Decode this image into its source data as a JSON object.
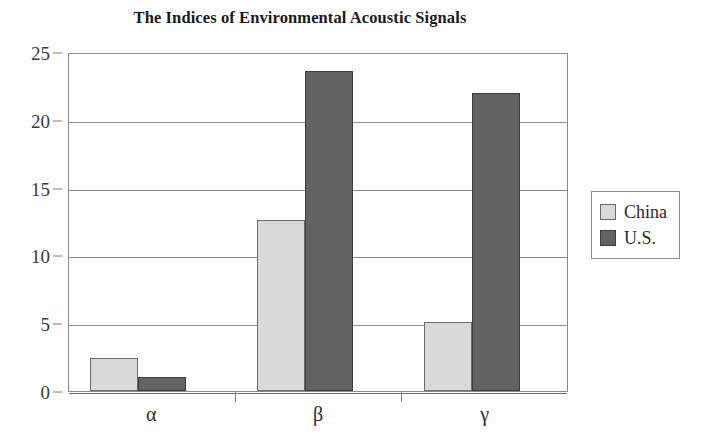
{
  "chart_data": {
    "type": "bar",
    "title": "The Indices of Environmental Acoustic Signals",
    "xlabel": "",
    "ylabel": "",
    "categories": [
      "α",
      "β",
      "γ"
    ],
    "series": [
      {
        "name": "China",
        "color": "#d9d9d9",
        "values": [
          2.4,
          12.6,
          5.1
        ]
      },
      {
        "name": "U.S.",
        "color": "#636363",
        "values": [
          1.0,
          23.6,
          22.0
        ]
      }
    ],
    "ylim": [
      0,
      25
    ],
    "yticks": [
      0,
      5,
      10,
      15,
      20,
      25
    ],
    "ytick_labels": [
      "0",
      "5",
      "10",
      "15",
      "20",
      "25"
    ],
    "grid": true,
    "legend_position": "right",
    "legend_entries": [
      "China",
      "U.S."
    ]
  },
  "axes": {
    "y_tick_labels": [
      "25",
      "20",
      "15",
      "10",
      "5",
      "0"
    ],
    "x_tick_labels": [
      "α",
      "β",
      "γ"
    ]
  },
  "legend": {
    "items": [
      {
        "label": "China",
        "swatch": "legend-swatch-china"
      },
      {
        "label": "U.S.",
        "swatch": "legend-swatch-us"
      }
    ]
  }
}
